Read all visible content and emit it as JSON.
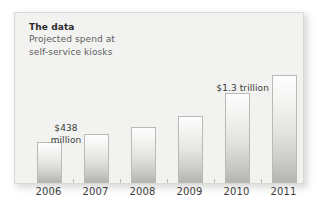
{
  "figure": {
    "heading": {
      "title": "The data",
      "subtitle_line1": "Projected spend at",
      "subtitle_line2": "self-service kiosks"
    },
    "colors": {
      "panel_background": "#f2f2f0",
      "panel_border": "#d8d8d4",
      "bar_top": "#fdfdfd",
      "bar_bottom": "#b4b4b1",
      "bar_outline": "#b9b9b6",
      "title_text": "#2b2b2b",
      "subtitle_text": "#5d5d5d",
      "axis_label_text": "#3d3d3d",
      "axis_line": "#c3c3c0"
    }
  },
  "chart_data": {
    "type": "bar",
    "title": "The data",
    "subtitle": "Projected spend at self-service kiosks",
    "xlabel": "",
    "ylabel": "",
    "grid": false,
    "legend": "none",
    "categories": [
      "2006",
      "2007",
      "2008",
      "2009",
      "2010",
      "2011"
    ],
    "values": [
      438,
      520,
      600,
      740,
      1000,
      1300
    ],
    "value_unit": "relative bar height (axis unlabeled)",
    "ylim": [
      0,
      1400
    ],
    "tick_labels": [
      "2006",
      "2007",
      "2008",
      "2009",
      "2010",
      "2011"
    ],
    "annotations": [
      {
        "category": "2006",
        "text": "$438\nmillion",
        "display_line1": "$438",
        "display_line2": "million",
        "position": "above-left"
      },
      {
        "category": "2011",
        "text": "$1.3 trillion",
        "display_line1": "$1.3 trillion",
        "position": "above-left"
      }
    ],
    "bars": [
      {
        "category": "2006",
        "x": 22,
        "width": 25,
        "top": 129,
        "height": 41
      },
      {
        "category": "2007",
        "x": 69,
        "width": 25,
        "top": 121,
        "height": 49
      },
      {
        "category": "2008",
        "x": 116,
        "width": 25,
        "top": 114,
        "height": 56
      },
      {
        "category": "2009",
        "x": 163,
        "width": 25,
        "top": 103,
        "height": 67
      },
      {
        "category": "2010",
        "x": 210,
        "width": 25,
        "top": 80,
        "height": 90
      },
      {
        "category": "2011",
        "x": 257,
        "width": 25,
        "top": 62,
        "height": 108
      }
    ],
    "ticks_x": [
      58,
      105,
      152,
      199,
      246
    ]
  }
}
